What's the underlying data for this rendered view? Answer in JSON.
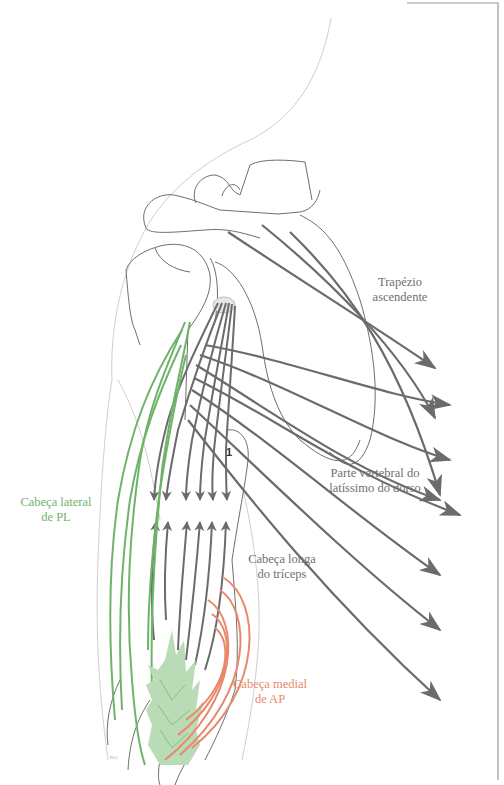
{
  "figure": {
    "type": "anatomical-diagram",
    "colors": {
      "outline": "#8a8a8a",
      "outline_light": "#cfcfcf",
      "arrows": "#6b6b6b",
      "lateral_head": "#6fb36a",
      "medial_head": "#e8896b",
      "muscle_fill": "#b9dbb5",
      "frame": "#9a9a9a"
    }
  },
  "labels": {
    "trapezius": [
      "Trapézio",
      "ascendente"
    ],
    "latissimus": [
      "Parte vertebral do",
      "latíssimo do dorso"
    ],
    "lateral_head": [
      "Cabeça lateral",
      "de PL"
    ],
    "long_head": [
      "Cabeça longa",
      "do tríceps"
    ],
    "medial_head": [
      "Cabeça medial",
      "de AP"
    ],
    "marker_1": "1",
    "signature": "PLC"
  }
}
